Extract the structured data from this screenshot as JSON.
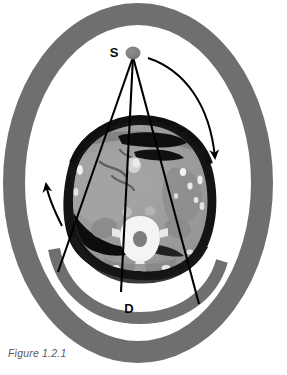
{
  "figure": {
    "caption": "Figure 1.2.1",
    "labels": {
      "source": "S",
      "detector": "D"
    },
    "colors": {
      "gantry_ring": "#6f6f6f",
      "detector_arc": "#6f6f6f",
      "source_dot": "#808080",
      "beam_line": "#000000",
      "arrow": "#000000",
      "background": "#ffffff",
      "caption": "#5b5b5b",
      "label": "#0a0a0a",
      "body_rim": "#111111",
      "soft_tissue": "#9a9a9a",
      "bone_bright": "#f2f2f2",
      "gas_dark": "#0d0d0d"
    },
    "geometry": {
      "ring": {
        "cx": 138,
        "cy": 183,
        "outer_rx": 124,
        "outer_ry": 169,
        "band_width": 22
      },
      "source_point": {
        "x": 133,
        "y": 54,
        "r": 7
      },
      "beam_rays": [
        {
          "name": "left-ray",
          "x1": 133,
          "y1": 56,
          "x2": 58,
          "y2": 272
        },
        {
          "name": "center-ray",
          "x1": 133,
          "y1": 56,
          "x2": 120,
          "y2": 290
        },
        {
          "name": "right-ray",
          "x1": 133,
          "y1": 56,
          "x2": 198,
          "y2": 303
        }
      ],
      "detector_arc": {
        "cx": 138,
        "cy": 183,
        "rx": 93,
        "ry": 124,
        "start_angle_deg": 25,
        "end_angle_deg": 155,
        "thickness": 11
      },
      "rotation_arrow_right": {
        "from": {
          "x": 150,
          "y": 58
        },
        "to": {
          "x": 216,
          "y": 166
        },
        "direction": "clockwise"
      },
      "rotation_arrow_left": {
        "from": {
          "x": 61,
          "y": 224
        },
        "to": {
          "x": 45,
          "y": 181
        },
        "direction": "clockwise"
      },
      "ct_slice": {
        "cx": 139,
        "cy": 197,
        "rx": 72,
        "ry": 78
      }
    },
    "anatomy": [
      {
        "name": "body-wall-rim",
        "tissue": "skin-subcutaneous-fat"
      },
      {
        "name": "liver",
        "tissue": "soft-tissue"
      },
      {
        "name": "vertebral-body",
        "tissue": "bone"
      },
      {
        "name": "spinal-canal",
        "tissue": "canal"
      },
      {
        "name": "bowel-gas-crescent",
        "tissue": "gas"
      },
      {
        "name": "stomach-gas",
        "tissue": "gas"
      },
      {
        "name": "kidney-left",
        "tissue": "soft-tissue"
      },
      {
        "name": "kidney-right",
        "tissue": "soft-tissue"
      },
      {
        "name": "aorta",
        "tissue": "vessel"
      }
    ]
  }
}
